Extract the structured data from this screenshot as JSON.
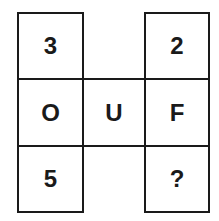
{
  "puzzle": {
    "cells": {
      "r1c1": "3",
      "r1c3": "2",
      "r2c1": "O",
      "r2c2": "U",
      "r2c3": "F",
      "r3c1": "5",
      "r3c3": "?"
    }
  }
}
